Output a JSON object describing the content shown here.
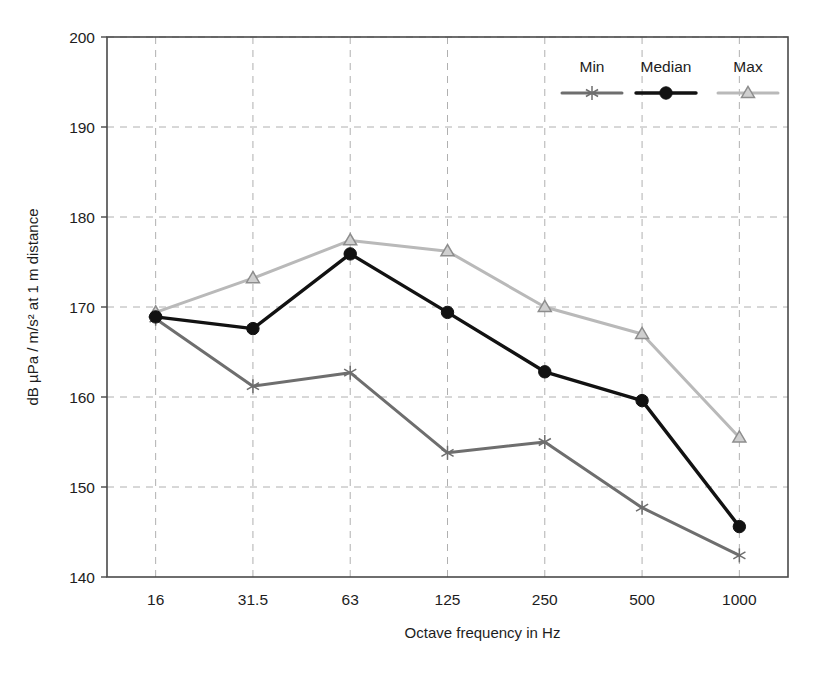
{
  "chart_data": {
    "type": "line",
    "title": "",
    "xlabel": "Octave frequency in Hz",
    "ylabel": "dB µPa / m/s² at 1 m distance",
    "categories": [
      "16",
      "31.5",
      "63",
      "125",
      "250",
      "500",
      "1000"
    ],
    "xtick_labels": [
      "16",
      "31.5",
      "63",
      "125",
      "250",
      "500",
      "1000"
    ],
    "ytick_labels": [
      "140",
      "150",
      "160",
      "170",
      "180",
      "190",
      "200"
    ],
    "yticks": [
      140,
      150,
      160,
      170,
      180,
      190,
      200
    ],
    "ylim": [
      140,
      200
    ],
    "grid": true,
    "grid_style": "dashed",
    "legend_position": "top-right",
    "series": [
      {
        "name": "Min",
        "color": "#6e6e6e",
        "marker": "asterisk",
        "values": [
          168.7,
          161.2,
          162.7,
          153.8,
          155.0,
          147.7,
          142.4
        ]
      },
      {
        "name": "Median",
        "color": "#121212",
        "marker": "circle",
        "values": [
          168.9,
          167.6,
          175.9,
          169.4,
          162.8,
          159.6,
          145.6
        ]
      },
      {
        "name": "Max",
        "color": "#b9b9b9",
        "marker": "triangle",
        "values": [
          169.4,
          173.2,
          177.4,
          176.2,
          170.0,
          167.0,
          155.5
        ]
      }
    ]
  },
  "legend": {
    "entries": [
      "Min",
      "Median",
      "Max"
    ]
  },
  "colors": {
    "min": "#6e6e6e",
    "median": "#121212",
    "max": "#b9b9b9",
    "axis": "#4a4a4a",
    "grid": "#b0b0b0",
    "background": "#ffffff"
  }
}
